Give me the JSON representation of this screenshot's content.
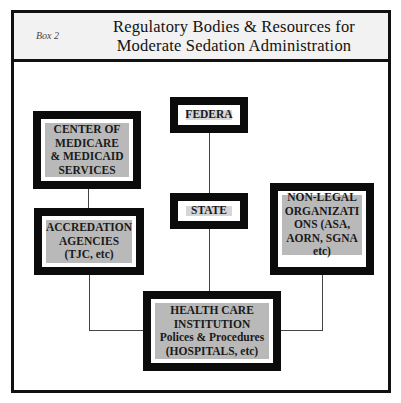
{
  "header": {
    "box_label": "Box 2",
    "title_line1": "Regulatory Bodies &  Resources for",
    "title_line2": "Moderate  Sedation  Administration"
  },
  "nodes": {
    "cms": "CENTER OF MEDICARE & MEDICAID SERVICES",
    "federal": "FEDERA",
    "state": "STATE",
    "accreditation": "ACCREDATION AGENCIES (TJC, etc)",
    "non_legal": "NON-LEGAL ORGANIZATI ONS (ASA, AORN, SGNA etc)",
    "hospital_line1": "HEALTH CARE INSTITUTION",
    "hospital_line2": "Polices & Procedures",
    "hospital_line3": "(HOSPITALS, etc)"
  },
  "colors": {
    "border": "#0b0b0b",
    "fill": "#b9b9b9",
    "header_bg": "#f2f2f2"
  }
}
